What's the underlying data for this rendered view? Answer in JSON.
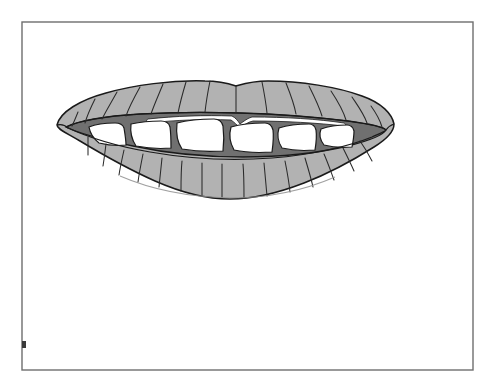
{
  "document": {
    "title": "Mouth Illustration",
    "background_color": "#ffffff"
  },
  "frame": {
    "name": "image-border",
    "x": 22,
    "y": 22,
    "width": 451,
    "height": 348,
    "stroke_color": "#6e6e6e",
    "stroke_width": 1.4,
    "fill": "none",
    "tick_mark": {
      "name": "left-border-tick",
      "x": 22,
      "y": 341,
      "width": 4,
      "height": 7,
      "color": "#3a3a3a"
    }
  },
  "illustration": {
    "name": "mouth-line-drawing",
    "subject": "lips-with-teeth",
    "style": "grayscale-line-art",
    "colors": {
      "lip_fill": "#b2b2b2",
      "lip_outline": "#1a1a1a",
      "crease_line": "#2a2a2a",
      "mouth_cavity": "#707070",
      "cavity_outline": "#1a1a1a",
      "tooth_fill": "#ffffff",
      "tooth_outline": "#1a1a1a",
      "upper_inner_band": "#ffffff"
    },
    "bounds": {
      "left": 57,
      "top": 80,
      "right": 394,
      "bottom": 200
    },
    "upper_lip": {
      "name": "upper-lip",
      "crease_count": 14,
      "cupid_bow_x": 236,
      "cupid_bow_y": 85
    },
    "lower_lip": {
      "name": "lower-lip",
      "crease_count": 15,
      "lowest_point_y": 199
    },
    "teeth": {
      "name": "upper-teeth-row",
      "count": 6,
      "row_top_y": 122,
      "row_bottom_y": 151
    },
    "mouth_cavity": {
      "name": "mouth-cavity",
      "left_corner_x": 66,
      "right_corner_x": 386,
      "center_y": 130
    }
  }
}
